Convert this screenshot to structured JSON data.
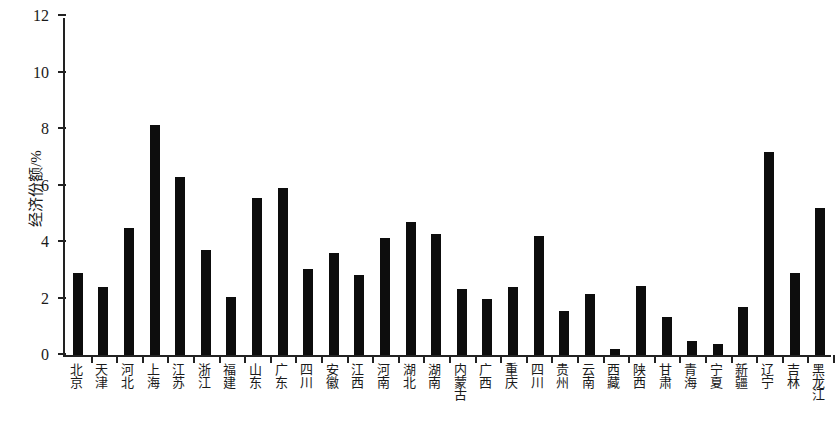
{
  "chart_data": {
    "type": "bar",
    "title": "",
    "subtitle": "",
    "xlabel": "",
    "ylabel": "经济份额/%",
    "ylim": [
      0,
      12
    ],
    "ytick_labels": [
      "0",
      "2",
      "4",
      "6",
      "8",
      "10",
      "12"
    ],
    "ytick_values": [
      0,
      2,
      4,
      6,
      8,
      10,
      12
    ],
    "grid": false,
    "legend": null,
    "bar_color": "#0d0d0d",
    "axis_color": "#222222",
    "categories": [
      "北京",
      "天津",
      "河北",
      "上海",
      "江苏",
      "浙江",
      "福建",
      "山东",
      "广东",
      "四川",
      "安徽",
      "江西",
      "河南",
      "湖北",
      "湖南",
      "内蒙古",
      "广西",
      "重庆",
      "四川",
      "贵州",
      "云南",
      "西藏",
      "陕西",
      "甘肃",
      "青海",
      "宁夏",
      "新疆",
      "辽宁",
      "吉林",
      "黑龙江"
    ],
    "values": [
      2.9,
      2.4,
      4.5,
      8.15,
      6.3,
      3.7,
      2.05,
      5.55,
      5.9,
      3.05,
      3.6,
      2.85,
      4.15,
      4.7,
      4.3,
      2.35,
      2.0,
      2.4,
      4.2,
      1.55,
      2.15,
      0.2,
      2.45,
      1.35,
      0.5,
      0.4,
      1.7,
      7.2,
      2.9,
      5.2
    ],
    "units": "%"
  }
}
